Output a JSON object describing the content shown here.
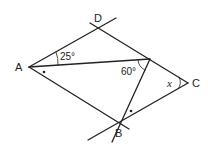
{
  "diagram": {
    "type": "geometry",
    "points": {
      "A": {
        "label": "A",
        "x": 29,
        "y": 67
      },
      "D": {
        "label": "D",
        "x": 99,
        "y": 28
      },
      "C": {
        "label": "C",
        "x": 188,
        "y": 83
      },
      "B": {
        "label": "B",
        "x": 120,
        "y": 123
      },
      "E": {
        "x": 150,
        "y": 59
      }
    },
    "angles": {
      "DAE": "25°",
      "AEB": "60°",
      "C": "x"
    },
    "marks": {
      "equal_angle_dot": "•"
    }
  }
}
